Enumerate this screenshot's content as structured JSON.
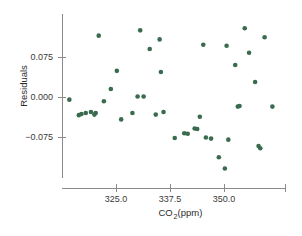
{
  "chart_data": {
    "type": "scatter",
    "title": "",
    "xlabel": "CO2(ppm)",
    "xlabel_base": "CO",
    "xlabel_sub": "2",
    "xlabel_rest": "(ppm)",
    "ylabel": "Residuals",
    "xticks": [
      325.0,
      337.5,
      350.0
    ],
    "xtick_labels": [
      "325.0",
      "337.5",
      "350.0"
    ],
    "yticks": [
      0.075,
      0.0,
      -0.075
    ],
    "ytick_labels": [
      "0.075",
      "0.000",
      "−0.075"
    ],
    "xlim": [
      313.0,
      362.5
    ],
    "ylim": [
      -0.155,
      0.135
    ],
    "grid": false,
    "legend": false,
    "marker_color": "#3a6b4f",
    "marker_size_px": 4.6,
    "axis_color": "#8a8a8a",
    "background": "#ffffff",
    "n_points": 44,
    "points": [
      {
        "x": 314.2,
        "y": -0.005
      },
      {
        "x": 317.0,
        "y": -0.032
      },
      {
        "x": 318.0,
        "y": -0.03
      },
      {
        "x": 319.2,
        "y": -0.028
      },
      {
        "x": 320.3,
        "y": -0.03
      },
      {
        "x": 321.0,
        "y": 0.115
      },
      {
        "x": 322.2,
        "y": -0.008
      },
      {
        "x": 323.8,
        "y": 0.015
      },
      {
        "x": 325.2,
        "y": 0.049
      },
      {
        "x": 326.2,
        "y": -0.042
      },
      {
        "x": 328.8,
        "y": -0.03
      },
      {
        "x": 330.6,
        "y": 0.125
      },
      {
        "x": 331.4,
        "y": 0.001
      },
      {
        "x": 332.8,
        "y": 0.09
      },
      {
        "x": 334.2,
        "y": -0.033
      },
      {
        "x": 335.1,
        "y": 0.108
      },
      {
        "x": 335.4,
        "y": 0.047
      },
      {
        "x": 338.6,
        "y": -0.077
      },
      {
        "x": 340.8,
        "y": -0.068
      },
      {
        "x": 341.6,
        "y": -0.069
      },
      {
        "x": 343.2,
        "y": -0.059
      },
      {
        "x": 344.4,
        "y": -0.037
      },
      {
        "x": 345.2,
        "y": 0.098
      },
      {
        "x": 345.8,
        "y": -0.076
      },
      {
        "x": 348.8,
        "y": -0.113
      },
      {
        "x": 350.2,
        "y": -0.134
      },
      {
        "x": 350.6,
        "y": 0.096
      },
      {
        "x": 351.0,
        "y": -0.08
      },
      {
        "x": 352.6,
        "y": 0.06
      },
      {
        "x": 353.6,
        "y": -0.017
      },
      {
        "x": 354.8,
        "y": 0.129
      },
      {
        "x": 355.8,
        "y": 0.083
      },
      {
        "x": 357.2,
        "y": 0.028
      },
      {
        "x": 358.0,
        "y": -0.092
      },
      {
        "x": 358.4,
        "y": -0.096
      },
      {
        "x": 359.4,
        "y": 0.112
      },
      {
        "x": 361.2,
        "y": -0.018
      },
      {
        "x": 316.4,
        "y": -0.034
      },
      {
        "x": 320.0,
        "y": -0.033
      },
      {
        "x": 330.0,
        "y": 0.001
      },
      {
        "x": 336.0,
        "y": -0.028
      },
      {
        "x": 343.8,
        "y": -0.06
      },
      {
        "x": 353.2,
        "y": -0.018
      },
      {
        "x": 347.0,
        "y": -0.078
      }
    ]
  }
}
